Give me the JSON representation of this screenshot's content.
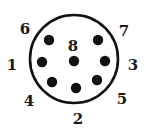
{
  "diagram": {
    "type": "connector-pinout",
    "pin_count": 8,
    "housing": {
      "cx": 74,
      "cy": 59,
      "r": 44,
      "stroke": "#111111",
      "stroke_width": 2.6
    },
    "pin_color": "#111111",
    "label_color": "#1a1a1a",
    "pins": [
      {
        "id": "1",
        "label": "1",
        "x": 42,
        "y": 62,
        "label_x": 12,
        "label_y": 70
      },
      {
        "id": "2",
        "label": "2",
        "x": 76,
        "y": 88,
        "label_x": 78,
        "label_y": 124
      },
      {
        "id": "3",
        "label": "3",
        "x": 105,
        "y": 61,
        "label_x": 133,
        "label_y": 70
      },
      {
        "id": "4",
        "label": "4",
        "x": 52,
        "y": 82,
        "label_x": 29,
        "label_y": 106
      },
      {
        "id": "5",
        "label": "5",
        "x": 97,
        "y": 80,
        "label_x": 122,
        "label_y": 104
      },
      {
        "id": "6",
        "label": "6",
        "x": 49,
        "y": 40,
        "label_x": 25,
        "label_y": 34
      },
      {
        "id": "7",
        "label": "7",
        "x": 98,
        "y": 40,
        "label_x": 124,
        "label_y": 36
      },
      {
        "id": "8",
        "label": "8",
        "x": 74,
        "y": 61,
        "label_x": 73,
        "label_y": 51
      }
    ]
  }
}
